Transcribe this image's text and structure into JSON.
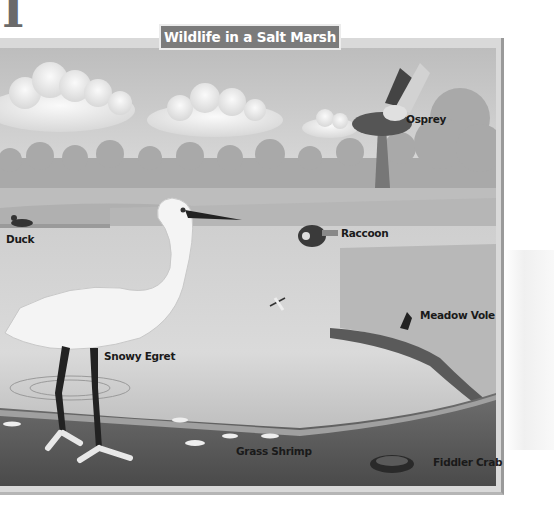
{
  "page": {
    "corner_letter": "I"
  },
  "figure": {
    "title": "Wildlife in a Salt Marsh",
    "labels": [
      {
        "id": "osprey",
        "text": "Osprey"
      },
      {
        "id": "duck",
        "text": "Duck"
      },
      {
        "id": "raccoon",
        "text": "Raccoon"
      },
      {
        "id": "meadow-vole",
        "text": "Meadow Vole"
      },
      {
        "id": "snowy-egret",
        "text": "Snowy Egret"
      },
      {
        "id": "grass-shrimp",
        "text": "Grass Shrimp"
      },
      {
        "id": "fiddler-crab",
        "text": "Fiddler Crab"
      }
    ],
    "colors": {
      "sky": "#c9c9c9",
      "cloud": "#f2f2f2",
      "treeline": "#a8a8a8",
      "marsh_grass": "#b8b8b8",
      "water": "#d4d4d4",
      "mud": "#5e5e5e",
      "title_bg": "#7b7b7b"
    }
  }
}
